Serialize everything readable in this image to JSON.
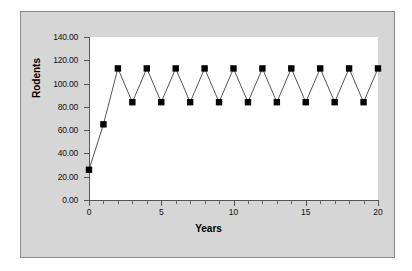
{
  "chart_data": {
    "type": "line",
    "title": "",
    "xlabel": "Years",
    "ylabel": "Rodents",
    "xlim": [
      0,
      20
    ],
    "ylim": [
      0,
      140
    ],
    "grid": false,
    "legend": null,
    "y_tick_labels": [
      "0.00",
      "20.00",
      "40.00",
      "60.00",
      "80.00",
      "100.00",
      "120.00",
      "140.00"
    ],
    "y_tick_values": [
      0,
      20,
      40,
      60,
      80,
      100,
      120,
      140
    ],
    "x_tick_labels": [
      "0",
      "5",
      "10",
      "15",
      "20"
    ],
    "x_tick_values": [
      0,
      5,
      10,
      15,
      20
    ],
    "x_minor_step": 1,
    "series": [
      {
        "name": "Rodents",
        "marker": "square",
        "marker_color": "#000000",
        "line_color": "#555555",
        "x": [
          0,
          1,
          2,
          3,
          4,
          5,
          6,
          7,
          8,
          9,
          10,
          11,
          12,
          13,
          14,
          15,
          16,
          17,
          18,
          19,
          20
        ],
        "values": [
          26,
          65,
          113,
          84,
          113,
          84,
          113,
          84,
          113,
          84,
          113,
          84,
          113,
          84,
          113,
          84,
          113,
          84,
          113,
          84,
          113
        ]
      }
    ]
  },
  "figure": {
    "background_color": "#d6d6d6",
    "plot_background_color": "#ffffff",
    "border_color": "#8a8a8a",
    "axis_color": "#555555"
  }
}
